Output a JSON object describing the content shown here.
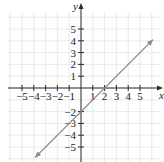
{
  "chart_data": {
    "type": "line",
    "title": "",
    "xlabel": "x",
    "ylabel": "y",
    "xlim": [
      -6,
      6.5
    ],
    "ylim": [
      -6,
      6.5
    ],
    "grid": true,
    "x_ticks": [
      -5,
      -4,
      -3,
      -2,
      -1,
      1,
      2,
      3,
      4,
      5
    ],
    "y_ticks": [
      5,
      4,
      3,
      2,
      1,
      -2,
      -3,
      -4,
      -5
    ],
    "x_tick_labels": [
      "−5",
      "−4",
      "−3",
      "−2",
      "−1",
      "1",
      "2",
      "3",
      "4",
      "5"
    ],
    "y_tick_labels": [
      "5",
      "4",
      "3",
      "2",
      "1",
      "−2",
      "−3",
      "−4",
      "−5"
    ],
    "series": [
      {
        "name": "y = x - 2",
        "equation": "y = x - 2",
        "slope": 1,
        "intercept": -2,
        "x_intercept": 2,
        "y_intercept": -2,
        "x": [
          -3.9,
          6.1
        ],
        "y": [
          -5.9,
          4.1
        ],
        "arrows_both_ends": true,
        "color": "#8a8a8a"
      }
    ]
  },
  "axes": {
    "x_label": "x",
    "y_label": "y",
    "axis_color": "#2a2a2a",
    "grid_color": "#e4e4e4"
  }
}
